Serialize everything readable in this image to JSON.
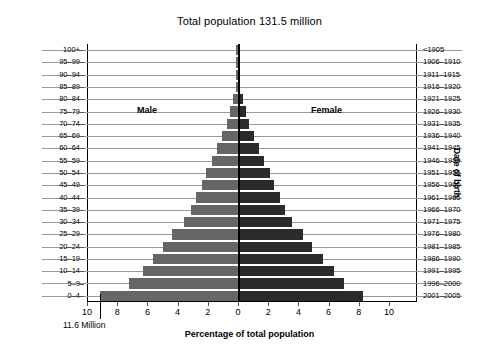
{
  "title": "Total population 131.5 million",
  "axis": {
    "y_left_title": "Age",
    "y_right_title": "Date of birth",
    "x_title": "Percentage of total population"
  },
  "series_labels": {
    "male": "Male",
    "female": "Female"
  },
  "annotation": {
    "text": "11.6 Million",
    "value": 9.15
  },
  "colors": {
    "male": "#666666",
    "female": "#2b2b2b",
    "gridline": "#9a9a9a",
    "axis": "#000000",
    "background": "#ffffff"
  },
  "xticks": [
    {
      "label": "10",
      "value": -10
    },
    {
      "label": "8",
      "value": -8
    },
    {
      "label": "6",
      "value": -6
    },
    {
      "label": "4",
      "value": -4
    },
    {
      "label": "2",
      "value": -2
    },
    {
      "label": "0",
      "value": 0
    },
    {
      "label": "2",
      "value": 2
    },
    {
      "label": "4",
      "value": 4
    },
    {
      "label": "6",
      "value": 6
    },
    {
      "label": "8",
      "value": 8
    },
    {
      "label": "10",
      "value": 10
    }
  ],
  "chart_data": {
    "type": "bar",
    "subtype": "population-pyramid",
    "title": "Total population 131.5 million",
    "xlabel": "Percentage of total population",
    "ylabel": "Age",
    "ylabel_right": "Date of birth",
    "xlim": [
      -10,
      10
    ],
    "grid": true,
    "legend": "in-plot",
    "categories": [
      "100+",
      "95–99",
      "90–94",
      "85–89",
      "80–84",
      "75–79",
      "70–74",
      "65–69",
      "60–64",
      "55–59",
      "50–54",
      "45–49",
      "40–44",
      "35–39",
      "30–34",
      "25–29",
      "20–24",
      "15–19",
      "10–14",
      "5–9",
      "0–4"
    ],
    "categories_right": [
      "<1905",
      "1906–1910",
      "1911–1915",
      "1916–1920",
      "1921–1925",
      "1926–1930",
      "1931–1935",
      "1936–1940",
      "1941–1945",
      "1946–1950",
      "1951–1955",
      "1956–1960",
      "1961–1965",
      "1966–1970",
      "1971–1975",
      "1976–1980",
      "1981–1985",
      "1986–1990",
      "1991–1995",
      "1996–2000",
      "2001–2005"
    ],
    "series": [
      {
        "name": "Male",
        "side": "left",
        "color": "#666666",
        "values": [
          0.03,
          0.05,
          0.08,
          0.15,
          0.3,
          0.5,
          0.75,
          1.05,
          1.4,
          1.75,
          2.1,
          2.4,
          2.75,
          3.1,
          3.6,
          4.35,
          5.0,
          5.6,
          6.3,
          7.2,
          9.15
        ]
      },
      {
        "name": "Female",
        "side": "right",
        "color": "#2b2b2b",
        "values": [
          0.03,
          0.05,
          0.08,
          0.15,
          0.3,
          0.5,
          0.75,
          1.05,
          1.4,
          1.75,
          2.1,
          2.4,
          2.75,
          3.1,
          3.6,
          4.3,
          4.9,
          5.6,
          6.35,
          7.05,
          8.3
        ]
      }
    ],
    "annotations": [
      {
        "text": "11.6 Million",
        "x": -9.15,
        "target": "0–4 male bar"
      }
    ]
  }
}
